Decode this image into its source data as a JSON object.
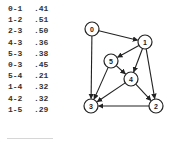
{
  "edges": [
    {
      "pair": "0-1",
      "weight": ".41"
    },
    {
      "pair": "1-2",
      "weight": ".51"
    },
    {
      "pair": "2-3",
      "weight": ".50"
    },
    {
      "pair": "4-3",
      "weight": ".36"
    },
    {
      "pair": "5-3",
      "weight": ".38"
    },
    {
      "pair": "0-3",
      "weight": ".45"
    },
    {
      "pair": "5-4",
      "weight": ".21"
    },
    {
      "pair": "1-4",
      "weight": ".32"
    },
    {
      "pair": "4-2",
      "weight": ".32"
    },
    {
      "pair": "1-5",
      "weight": ".29"
    }
  ],
  "graph": {
    "nodes": [
      {
        "id": "0",
        "label": "0",
        "x": 92,
        "y": 29
      },
      {
        "id": "1",
        "label": "1",
        "x": 145,
        "y": 42
      },
      {
        "id": "2",
        "label": "2",
        "x": 156,
        "y": 106
      },
      {
        "id": "3",
        "label": "3",
        "x": 91,
        "y": 106
      },
      {
        "id": "4",
        "label": "4",
        "x": 131,
        "y": 79
      },
      {
        "id": "5",
        "label": "5",
        "x": 111,
        "y": 61
      }
    ],
    "directed_edges": [
      [
        "0",
        "1"
      ],
      [
        "0",
        "3"
      ],
      [
        "1",
        "5"
      ],
      [
        "1",
        "4"
      ],
      [
        "1",
        "2"
      ],
      [
        "5",
        "4"
      ],
      [
        "5",
        "3"
      ],
      [
        "4",
        "3"
      ],
      [
        "4",
        "2"
      ],
      [
        "2",
        "3"
      ]
    ],
    "colors": {
      "stroke": "#222222",
      "fill": "#ffffff"
    }
  }
}
